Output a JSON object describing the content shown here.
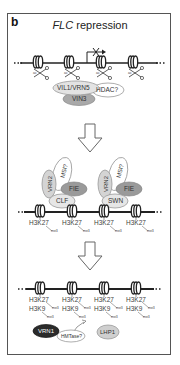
{
  "figure": {
    "panel_label": "b",
    "title_gene": "FLC",
    "title_rest": " repression"
  },
  "stage1": {
    "nucleosome_count": 4,
    "acetyl_labels": [
      "ac",
      "ac",
      "ac",
      "ac"
    ],
    "transcription_blocked": true,
    "complex": {
      "vil1_vrn5": "VIL1/VRN5",
      "hdac": "HDAC?",
      "vin3": "VIN3"
    }
  },
  "stage2": {
    "complex_left": {
      "vrn2": "VRN2",
      "msi": "MSI?",
      "fie": "FIE",
      "core": "CLF"
    },
    "complex_right": {
      "vrn2": "VRN2",
      "msi": "MSI?",
      "fie": "FIE",
      "core": "SWN"
    },
    "marks": [
      {
        "mark": "H3K27",
        "sub": "me3"
      },
      {
        "mark": "H3K27",
        "sub": "me3"
      },
      {
        "mark": "H3K27",
        "sub": "me3"
      },
      {
        "mark": "H3K27",
        "sub": "me3"
      }
    ]
  },
  "stage3": {
    "marks": [
      {
        "mark1": "H3K27",
        "mark2": "H3K9",
        "sub1": "me3",
        "sub2": "me3"
      },
      {
        "mark1": "H3K27",
        "mark2": "H3K9",
        "sub1": "me3",
        "sub2": "me3"
      },
      {
        "mark1": "H3K27",
        "mark2": "H3K9",
        "sub1": "me3",
        "sub2": "me3"
      },
      {
        "mark1": "H3K27",
        "mark2": "H3K9",
        "sub1": "me3",
        "sub2": "me3"
      }
    ],
    "vrn1": "VRN1",
    "hmtase": "HMTase?",
    "lhp1": "LHP1"
  },
  "colors": {
    "line": "#222222",
    "dark_oval": "#2b2b2b",
    "mid_oval": "#9a9a9a",
    "light_oval": "#d6d6d6",
    "outline_oval": "#ffffff"
  }
}
